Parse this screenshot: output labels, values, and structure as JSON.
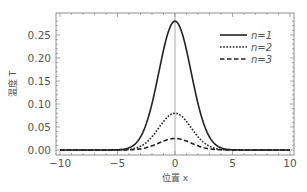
{
  "chart_data": {
    "type": "line",
    "title": "",
    "xlabel": "位置 x",
    "ylabel": "温度 T",
    "xlim": [
      -10,
      10
    ],
    "ylim": [
      -0.005,
      0.29
    ],
    "xticks": [
      -10,
      -5,
      0,
      5,
      10
    ],
    "xtick_labels": [
      "−10",
      "−5",
      "0",
      "5",
      "10"
    ],
    "yticks": [
      0.0,
      0.05,
      0.1,
      0.15,
      0.2,
      0.25
    ],
    "ytick_labels": [
      "0.00",
      "0.05",
      "0.10",
      "0.15",
      "0.20",
      "0.25"
    ],
    "grid": false,
    "legend_position": "upper right",
    "x": [
      -10,
      -5,
      -4,
      -3,
      -2,
      -1,
      0,
      1,
      2,
      3,
      4,
      5,
      10
    ],
    "series": [
      {
        "name": "n=1",
        "style": "solid",
        "values": [
          0,
          0.001,
          0.006,
          0.03,
          0.09,
          0.2,
          0.28,
          0.2,
          0.09,
          0.03,
          0.006,
          0.001,
          0
        ]
      },
      {
        "name": "n=2",
        "style": "dotted",
        "values": [
          0,
          0.0003,
          0.002,
          0.009,
          0.027,
          0.058,
          0.08,
          0.058,
          0.027,
          0.009,
          0.002,
          0.0003,
          0
        ]
      },
      {
        "name": "n=3",
        "style": "dashed",
        "values": [
          0,
          0.0001,
          0.0008,
          0.0035,
          0.009,
          0.018,
          0.025,
          0.018,
          0.009,
          0.0035,
          0.0008,
          0.0001,
          0
        ]
      }
    ],
    "peak_x": 0,
    "peaks": {
      "n=1": 0.28,
      "n=2": 0.08,
      "n=3": 0.025
    },
    "sigma": 1.4
  },
  "legend": {
    "items": [
      {
        "label": "n=1",
        "style": "solid"
      },
      {
        "label": "n=2",
        "style": "dotted"
      },
      {
        "label": "n=3",
        "style": "dashed"
      }
    ]
  },
  "colors": {
    "line": "#222222",
    "axis": "#555555",
    "text": "#555555"
  }
}
